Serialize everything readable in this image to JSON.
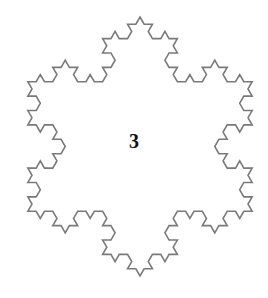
{
  "figure": {
    "type": "koch-snowflake",
    "iteration": 3,
    "label": "3",
    "center": [
      140,
      146.5
    ],
    "circumradius": 129.5,
    "stroke_color": "#7a7a7a",
    "stroke_width": 1.6,
    "fill": "none"
  }
}
